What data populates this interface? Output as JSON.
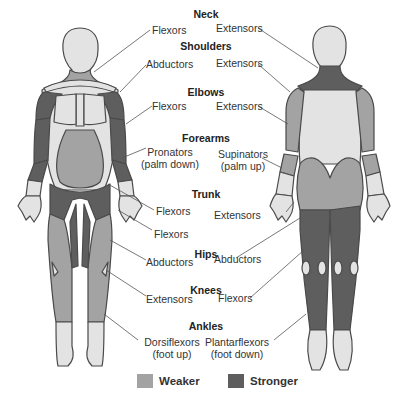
{
  "colors": {
    "weaker": "#a3a3a3",
    "stronger": "#5e5e5e",
    "skin": "#e3e3e3",
    "outline": "#4a4a4a"
  },
  "groups": [
    {
      "heading": "Neck",
      "left": "Flexors",
      "right": "Extensors"
    },
    {
      "heading": "Shoulders",
      "left": "Abductors",
      "right": "Extensors"
    },
    {
      "heading": "Elbows",
      "left": "Flexors",
      "right": "Extensors"
    },
    {
      "heading": "Forearms",
      "left_line1": "Pronators",
      "left_line2": "(palm down)",
      "right_line1": "Supinators",
      "right_line2": "(palm up)"
    },
    {
      "heading": "Trunk",
      "left": "Flexors",
      "right": "Extensors",
      "left_extra": "Flexors"
    },
    {
      "heading": "Hips",
      "left": "Abductors",
      "right": "Abductors"
    },
    {
      "heading": "Knees",
      "left": "Extensors",
      "right": "Flexors"
    },
    {
      "heading": "Ankles",
      "left_line1": "Dorsiflexors",
      "left_line2": "(foot up)",
      "right_line1": "Plantarflexors",
      "right_line2": "(foot down)"
    }
  ],
  "legend": {
    "weaker_label": "Weaker",
    "stronger_label": "Stronger"
  }
}
